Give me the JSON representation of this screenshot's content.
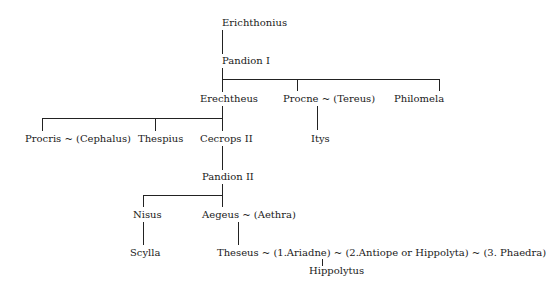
{
  "nodes": {
    "erichthonius": "Erichthonius",
    "pandion1": "Pandion I",
    "erechtheus": "Erechtheus",
    "procne": "Procne ~ (Tereus)",
    "philomela": "Philomela",
    "itys": "Itys",
    "procris": "Procris ~ (Cephalus)",
    "thespius": "Thespius",
    "cecrops2": "Cecrops II",
    "pandion2": "Pandion II",
    "nisus": "Nisus",
    "aegeus": "Aegeus ~ (Aethra)",
    "scylla": "Scylla",
    "theseus": "Theseus ~ (1.Ariadne) ~ (2.Antiope or Hippolyta) ~ (3. Phaedra)",
    "hippolytus": "Hippolytus"
  }
}
